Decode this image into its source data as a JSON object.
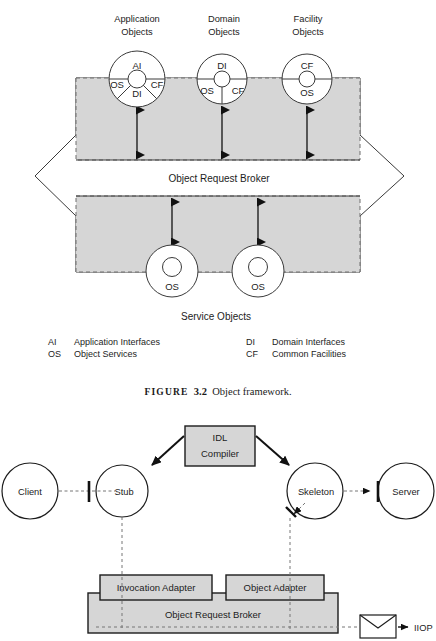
{
  "figure_top": {
    "column_headings": [
      {
        "line1": "Application",
        "line2": "Objects"
      },
      {
        "line1": "Domain",
        "line2": "Objects"
      },
      {
        "line1": "Facility",
        "line2": "Objects"
      }
    ],
    "objects": [
      {
        "name": "application-objects-circle",
        "segments": [
          "AI",
          "OS",
          "CF",
          "DI"
        ]
      },
      {
        "name": "domain-objects-circle",
        "segments": [
          "DI",
          "OS",
          "CF"
        ]
      },
      {
        "name": "facility-objects-circle",
        "segments": [
          "CF",
          "OS"
        ]
      }
    ],
    "broker_label": "Object Request Broker",
    "service_objects_label": "Service Objects",
    "service_objects": [
      {
        "label": "OS"
      },
      {
        "label": "OS"
      }
    ],
    "colors": {
      "panel_fill": "#d6d6d6",
      "stroke": "#3a3a3a",
      "text": "#1c1c1c"
    }
  },
  "legend": {
    "rows": [
      {
        "abbr_left": "AI",
        "name_left": "Application Interfaces",
        "abbr_right": "DI",
        "name_right": "Domain Interfaces"
      },
      {
        "abbr_left": "OS",
        "name_left": "Object Services",
        "abbr_right": "CF",
        "name_right": "Common Facilities"
      }
    ]
  },
  "caption": {
    "figure_word": "FIGURE",
    "number": "3.2",
    "title": "Object framework."
  },
  "figure_bottom": {
    "nodes": [
      {
        "id": "client",
        "label": "Client"
      },
      {
        "id": "stub",
        "label": "Stub"
      },
      {
        "id": "skeleton",
        "label": "Skeleton"
      },
      {
        "id": "server",
        "label": "Server"
      }
    ],
    "idl_compiler": {
      "line1": "IDL",
      "line2": "Compiler"
    },
    "adapters": [
      {
        "id": "invocation-adapter",
        "label": "Invocation Adapter"
      },
      {
        "id": "object-adapter",
        "label": "Object Adapter"
      }
    ],
    "broker_label": "Object Request Broker",
    "protocol_label": "IIOP",
    "envelope_icon": "envelope-icon",
    "colors": {
      "box_fill": "#d6d6d6",
      "stroke": "#1c1c1c",
      "dash": "#777777"
    }
  }
}
